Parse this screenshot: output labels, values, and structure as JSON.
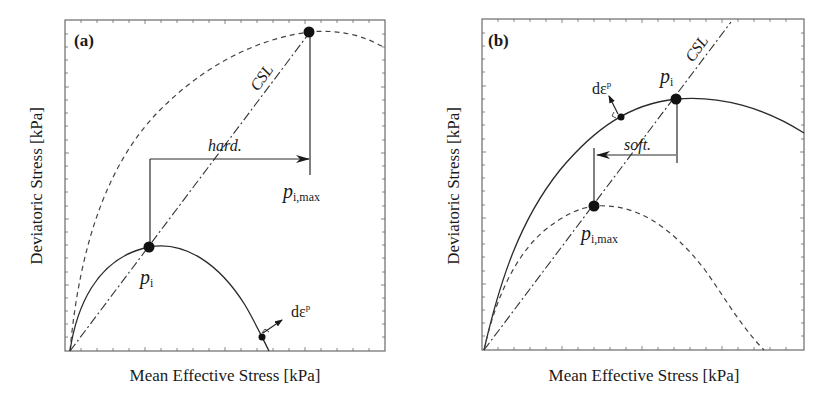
{
  "figure": {
    "panels": [
      {
        "id": "a",
        "label": "(a)",
        "xlabel": "Mean Effective Stress [kPa]",
        "ylabel": "Deviatoric Stress [kPa]",
        "csl_label": "CSL",
        "arrow_label": "hard.",
        "arrow_direction": "right",
        "point_pi": {
          "symbol": "p",
          "sub": "i"
        },
        "point_pimax": {
          "symbol": "p",
          "sub": "i,max"
        },
        "flow_label": {
          "symbol": "dε",
          "sup": "p"
        },
        "current_surface": "solid",
        "limit_surface": "dashed"
      },
      {
        "id": "b",
        "label": "(b)",
        "xlabel": "Mean Effective Stress [kPa]",
        "ylabel": "Deviatoric Stress [kPa]",
        "csl_label": "CSL",
        "arrow_label": "soft.",
        "arrow_direction": "left",
        "point_pi": {
          "symbol": "p",
          "sub": "i"
        },
        "point_pimax": {
          "symbol": "p",
          "sub": "i,max"
        },
        "flow_label": {
          "symbol": "dε",
          "sup": "p"
        },
        "current_surface": "solid",
        "limit_surface": "dashed"
      }
    ]
  }
}
